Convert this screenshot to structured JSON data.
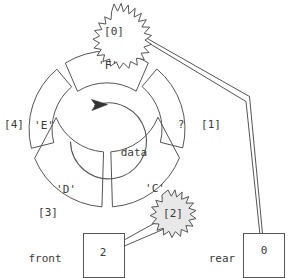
{
  "diagram": {
    "center_label": "data",
    "rotation_icon": "clockwise-arrow-icon",
    "colors": {
      "stroke": "#555555",
      "text": "#3a3a3a",
      "burst_fill_white": "#ffffff",
      "burst_fill_gray": "#e8e8e8",
      "background": "#ffffff"
    }
  },
  "ring": {
    "slots": [
      {
        "index_label": "[0]",
        "value": "'F'",
        "index": 0
      },
      {
        "index_label": "[1]",
        "value": "?",
        "index": 1
      },
      {
        "index_label": "[2]",
        "value": "'C'",
        "index": 2
      },
      {
        "index_label": "[3]",
        "value": "'D'",
        "index": 3
      },
      {
        "index_label": "[4]",
        "value": "'E'",
        "index": 4
      }
    ]
  },
  "pointers": {
    "front": {
      "label": "front",
      "value": "2",
      "points_to": "[2]"
    },
    "rear": {
      "label": "rear",
      "value": "0",
      "points_to": "[0]"
    }
  },
  "callouts": [
    {
      "name": "burst-index-0",
      "text": "[0]",
      "fill": "white"
    },
    {
      "name": "burst-index-2",
      "text": "[2]",
      "fill": "gray"
    }
  ]
}
